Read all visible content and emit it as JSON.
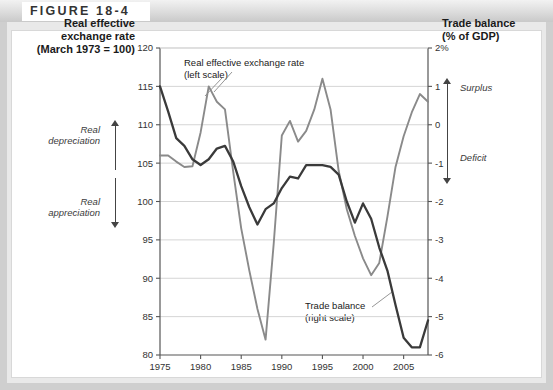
{
  "figure": {
    "label": "FIGURE 18-4"
  },
  "axes": {
    "left_title": "Real effective\nexchange rate\n(March 1973 = 100)",
    "right_title": "Trade balance\n(% of GDP)"
  },
  "annotations": {
    "real_depreciation": "Real\ndepreciation",
    "real_appreciation": "Real\nappreciation",
    "surplus": "Surplus",
    "deficit": "Deficit",
    "callout_exchange_rate": "Real effective exchange rate\n(left scale)",
    "callout_trade_balance": "Trade balance\n(right scale)"
  },
  "colors": {
    "exchange_rate_line": "#8a8a8a",
    "trade_balance_line": "#3a3a3a",
    "gridline": "#d5d5d5",
    "axis": "#555555",
    "frame": "#cfcfcf",
    "header_band": "#dcdcdc"
  },
  "chart_data": {
    "type": "line",
    "title": "FIGURE 18-4",
    "xlabel": "",
    "ylabel": "Real effective exchange rate (March 1973 = 100)",
    "y2label": "Trade balance (% of GDP)",
    "xlim": [
      1975,
      2008
    ],
    "ylim": [
      80,
      120
    ],
    "y2lim": [
      -6,
      2
    ],
    "grid": true,
    "legend": "in-chart callouts",
    "x_ticks": [
      1975,
      1980,
      1985,
      1990,
      1995,
      2000,
      2005
    ],
    "y_ticks": [
      80,
      85,
      90,
      95,
      100,
      105,
      110,
      115,
      120
    ],
    "y_tick_labels": [
      "80",
      "85",
      "90",
      "95",
      "100",
      "105",
      "110",
      "115",
      "120"
    ],
    "y2_ticks": [
      -6,
      -5,
      -4,
      -3,
      -2,
      -1,
      0,
      1,
      2
    ],
    "y2_tick_labels": [
      "-6",
      "-5",
      "-4",
      "-3",
      "-2",
      "-1",
      "0",
      "1",
      "2%"
    ],
    "x": [
      1975,
      1976,
      1977,
      1978,
      1979,
      1980,
      1981,
      1982,
      1983,
      1984,
      1985,
      1986,
      1987,
      1988,
      1989,
      1990,
      1991,
      1992,
      1993,
      1994,
      1995,
      1996,
      1997,
      1998,
      1999,
      2000,
      2001,
      2002,
      2003,
      2004,
      2005,
      2006,
      2007,
      2008
    ],
    "series": [
      {
        "name": "Real effective exchange rate (left scale)",
        "axis": "left",
        "color": "#8a8a8a",
        "values": [
          106.0,
          106.0,
          105.2,
          104.5,
          104.6,
          109.0,
          115.0,
          113.0,
          112.0,
          104.0,
          96.5,
          91.0,
          86.0,
          82.0,
          94.5,
          108.6,
          110.5,
          107.8,
          109.2,
          112.0,
          116.0,
          112.0,
          104.0,
          99.0,
          95.5,
          92.6,
          90.4,
          92.0,
          98.0,
          104.5,
          108.5,
          111.6,
          114.0,
          113.0
        ]
      },
      {
        "name": "Trade balance (right scale)",
        "axis": "right",
        "color": "#3a3a3a",
        "values": [
          1.0,
          0.35,
          -0.35,
          -0.55,
          -0.9,
          -1.05,
          -0.9,
          -0.62,
          -0.55,
          -0.95,
          -1.6,
          -2.15,
          -2.6,
          -2.2,
          -2.05,
          -1.65,
          -1.35,
          -1.4,
          -1.05,
          -1.05,
          -1.05,
          -1.1,
          -1.3,
          -2.0,
          -2.55,
          -2.05,
          -2.45,
          -3.2,
          -3.8,
          -4.7,
          -5.55,
          -5.8,
          -5.8,
          -5.1
        ]
      }
    ]
  }
}
